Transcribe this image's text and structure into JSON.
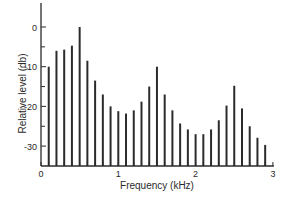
{
  "chart_data": {
    "type": "bar",
    "title": "",
    "xlabel": "Frequency (kHz)",
    "ylabel": "Relative level (db)",
    "xlim": [
      0,
      3
    ],
    "ylim": [
      -34,
      6
    ],
    "grid": false,
    "legend": null,
    "x_ticks": [
      0,
      1,
      2,
      3
    ],
    "x_tick_labels": [
      "0",
      "1",
      "2",
      "3"
    ],
    "y_ticks": [
      0,
      -10,
      -20,
      -30
    ],
    "y_tick_labels": [
      "0",
      "-10",
      "-20",
      "-30"
    ],
    "y_minor_ticks": [
      -5,
      -15,
      -25
    ],
    "x": [
      0.1,
      0.2,
      0.3,
      0.4,
      0.5,
      0.6,
      0.7,
      0.8,
      0.9,
      1.0,
      1.1,
      1.2,
      1.3,
      1.4,
      1.5,
      1.6,
      1.7,
      1.8,
      1.9,
      2.0,
      2.1,
      2.2,
      2.3,
      2.4,
      2.5,
      2.6,
      2.7,
      2.8,
      2.9
    ],
    "values": [
      -10,
      -6,
      -5.7,
      -4.7,
      0,
      -8.5,
      -13.5,
      -17,
      -20,
      -21.2,
      -21.8,
      -21,
      -18.8,
      -15,
      -10,
      -17,
      -21,
      -24.3,
      -25.8,
      -27,
      -27,
      -25.8,
      -23.5,
      -19.8,
      -14.8,
      -20.5,
      -25,
      -27.9,
      -29.7
    ]
  },
  "colors": {
    "bar": "#2b2b2b",
    "axis": "#2b2b2b",
    "background": "#ffffff"
  }
}
